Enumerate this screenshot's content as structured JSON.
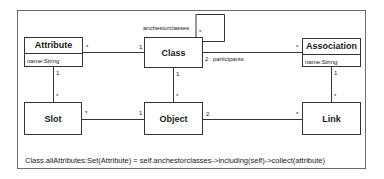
{
  "diagram": {
    "type": "UML class diagram",
    "classes": [
      {
        "id": "attribute",
        "name": "Attribute",
        "attributes": [
          "name:String"
        ]
      },
      {
        "id": "class",
        "name": "Class",
        "attributes": []
      },
      {
        "id": "association",
        "name": "Association",
        "attributes": [
          "name:String"
        ]
      },
      {
        "id": "slot",
        "name": "Slot",
        "attributes": []
      },
      {
        "id": "object",
        "name": "Object",
        "attributes": []
      },
      {
        "id": "link",
        "name": "Link",
        "attributes": []
      }
    ],
    "associations": [
      {
        "from": "Attribute",
        "to": "Class",
        "from_mult": "*",
        "to_mult": "1"
      },
      {
        "from": "Class",
        "to": "Association",
        "from_mult": "2",
        "from_role": "participants",
        "to_mult": "*"
      },
      {
        "from": "Class",
        "to": "Class",
        "role": "anchestorclasses",
        "mult": "*"
      },
      {
        "from": "Attribute",
        "to": "Slot",
        "from_mult": "1",
        "to_mult": "*"
      },
      {
        "from": "Class",
        "to": "Object",
        "from_mult": "1",
        "to_mult": "*"
      },
      {
        "from": "Association",
        "to": "Link",
        "from_mult": "1",
        "to_mult": "*"
      },
      {
        "from": "Slot",
        "to": "Object",
        "from_mult": "*",
        "to_mult": "1"
      },
      {
        "from": "Object",
        "to": "Link",
        "from_mult": "2",
        "to_mult": "*"
      }
    ],
    "labels": {
      "self_role": "anchestorclasses",
      "participants": "participants",
      "one": "1",
      "two": "2",
      "many": "*"
    },
    "constraint": "Class.allAttributes:Set(Attribute) = self.anchestorclasses->including(self)->collect(attribute)"
  }
}
